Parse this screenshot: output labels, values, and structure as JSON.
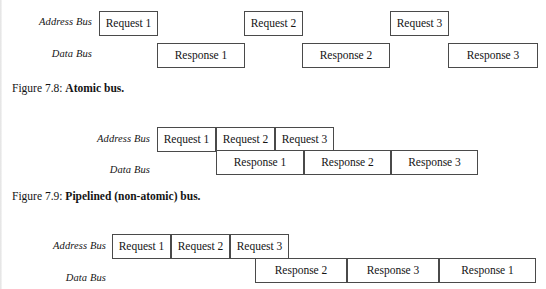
{
  "document": {
    "type": "textbook-figure-page",
    "background_color": "#ffffff",
    "box_border_color": "#4a4a4a",
    "text_color": "#141414"
  },
  "figures": [
    {
      "id": "figure-7-8",
      "caption_number": "Figure 7.8:",
      "caption_title": "Atomic bus.",
      "rows": [
        {
          "label": "Address Bus",
          "label_right_x": 92,
          "label_y": 16,
          "boxes": [
            {
              "text": "Request 1",
              "x": 99,
              "y": 11,
              "w": 59,
              "h": 25
            },
            {
              "text": "Request 2",
              "x": 244,
              "y": 11,
              "w": 59,
              "h": 25
            },
            {
              "text": "Request 3",
              "x": 390,
              "y": 11,
              "w": 59,
              "h": 25
            }
          ]
        },
        {
          "label": "Data Bus",
          "label_right_x": 92,
          "label_y": 48,
          "boxes": [
            {
              "text": "Response 1",
              "x": 157,
              "y": 43,
              "w": 88,
              "h": 25
            },
            {
              "text": "Response 2",
              "x": 302,
              "y": 43,
              "w": 88,
              "h": 25
            },
            {
              "text": "Response 3",
              "x": 448,
              "y": 43,
              "w": 90,
              "h": 25
            }
          ]
        }
      ],
      "caption_x": 12,
      "caption_y": 82
    },
    {
      "id": "figure-7-9",
      "caption_number": "Figure 7.9:",
      "caption_title": "Pipelined (non-atomic) bus.",
      "rows": [
        {
          "label": "Address Bus",
          "label_right_x": 150,
          "label_y": 133,
          "boxes": [
            {
              "text": "Request 1",
              "x": 157,
              "y": 127,
              "w": 59,
              "h": 25
            },
            {
              "text": "Request 2",
              "x": 216,
              "y": 127,
              "w": 59,
              "h": 25
            },
            {
              "text": "Request 3",
              "x": 275,
              "y": 127,
              "w": 59,
              "h": 25
            }
          ]
        },
        {
          "label": "Data Bus",
          "label_right_x": 150,
          "label_y": 164,
          "boxes": [
            {
              "text": "Response 1",
              "x": 216,
              "y": 150,
              "w": 88,
              "h": 25
            },
            {
              "text": "Response 2",
              "x": 304,
              "y": 150,
              "w": 87,
              "h": 25
            },
            {
              "text": "Response 3",
              "x": 391,
              "y": 150,
              "w": 87,
              "h": 25
            }
          ]
        }
      ],
      "caption_x": 12,
      "caption_y": 190
    },
    {
      "id": "figure-7-10",
      "caption_number": "",
      "caption_title": "",
      "rows": [
        {
          "label": "Address Bus",
          "label_right_x": 106,
          "label_y": 240,
          "boxes": [
            {
              "text": "Request 1",
              "x": 112,
              "y": 234,
              "w": 59,
              "h": 25
            },
            {
              "text": "Request 2",
              "x": 171,
              "y": 234,
              "w": 59,
              "h": 25
            },
            {
              "text": "Request 3",
              "x": 230,
              "y": 234,
              "w": 59,
              "h": 25
            }
          ]
        },
        {
          "label": "Data Bus",
          "label_right_x": 106,
          "label_y": 272,
          "boxes": [
            {
              "text": "Response 2",
              "x": 255,
              "y": 258,
              "w": 92,
              "h": 25
            },
            {
              "text": "Response 3",
              "x": 347,
              "y": 258,
              "w": 92,
              "h": 25
            },
            {
              "text": "Response 1",
              "x": 439,
              "y": 258,
              "w": 97,
              "h": 25
            }
          ]
        }
      ],
      "caption_x": 12,
      "caption_y": 0
    }
  ]
}
